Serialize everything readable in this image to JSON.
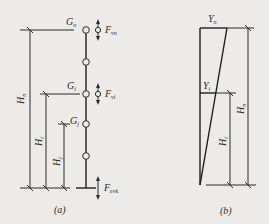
{
  "figure": {
    "panel_a": {
      "caption": "(a)",
      "masses": [
        {
          "label": "G",
          "sub": "n"
        },
        {
          "label": "G",
          "sub": "i"
        },
        {
          "label": "G",
          "sub": "j"
        }
      ],
      "forces": [
        {
          "label": "F",
          "sub": "vn"
        },
        {
          "label": "F",
          "sub": "vi"
        },
        {
          "label": "F",
          "sub": "evk"
        }
      ],
      "dimensions": [
        {
          "label": "H",
          "sub": "n"
        },
        {
          "label": "H",
          "sub": "i"
        },
        {
          "label": "H",
          "sub": "j"
        }
      ]
    },
    "panel_b": {
      "caption": "(b)",
      "values": [
        {
          "label": "Y",
          "sub": "n"
        },
        {
          "label": "Y",
          "sub": "i"
        }
      ],
      "dimensions": [
        {
          "label": "H",
          "sub": "i"
        },
        {
          "label": "H",
          "sub": "n"
        }
      ]
    },
    "colors": {
      "ink": "#2a2a2a",
      "paper": "#ecebe8"
    }
  }
}
